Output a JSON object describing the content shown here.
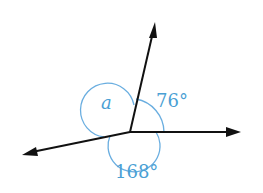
{
  "diagram": {
    "type": "angles-around-a-point",
    "colors": {
      "ray": "#111111",
      "arc": "#6aaee0",
      "label": "#4a9fd4"
    },
    "vertex": [
      130,
      132
    ],
    "rays": [
      {
        "name": "up",
        "end": [
          155,
          23
        ]
      },
      {
        "name": "east",
        "end": [
          240,
          132
        ]
      },
      {
        "name": "lower-left",
        "end": [
          22,
          154
        ]
      }
    ],
    "angles": [
      {
        "name": "angle-76",
        "label": "76°"
      },
      {
        "name": "angle-a",
        "label": "a"
      },
      {
        "name": "angle-168",
        "label": "168°"
      }
    ]
  }
}
